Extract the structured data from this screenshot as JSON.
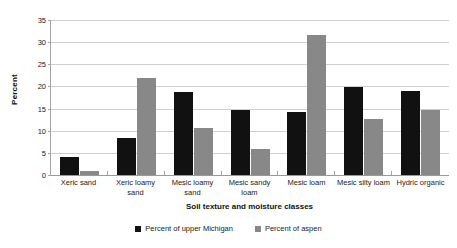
{
  "chart_data": {
    "type": "bar",
    "title": "",
    "xlabel": "Soil texture and moisture classes",
    "ylabel": "Percent",
    "ylim": [
      0,
      35
    ],
    "yticks": [
      0,
      5,
      10,
      15,
      20,
      25,
      30,
      35
    ],
    "grid": true,
    "legend_position": "bottom",
    "categories": [
      "Xeric sand",
      "Xeric loamy sand",
      "Mesic loamy sand",
      "Mesic sandy loam",
      "Mesic loam",
      "Mesic silty loam",
      "Hydric organic"
    ],
    "series": [
      {
        "name": "Percent of upper Michigan",
        "color": "#111111",
        "values": [
          4.0,
          8.4,
          18.8,
          14.7,
          14.3,
          19.8,
          19.0
        ]
      },
      {
        "name": "Percent of aspen",
        "color": "#888888",
        "values": [
          0.8,
          21.8,
          10.6,
          5.9,
          31.7,
          12.7,
          14.7
        ]
      }
    ]
  },
  "axes": {
    "y_title": "Percent",
    "x_title": "Soil texture and moisture classes",
    "y_tick_labels": [
      "0",
      "5",
      "10",
      "15",
      "20",
      "25",
      "30",
      "35"
    ],
    "x_tick_labels": [
      "Xeric sand",
      "Xeric loamy sand",
      "Mesic loamy sand",
      "Mesic sandy loam",
      "Mesic loam",
      "Mesic silty loam",
      "Hydric organic"
    ]
  },
  "legend": {
    "items": [
      {
        "label": "Percent of upper Michigan",
        "color": "#111111"
      },
      {
        "label": "Percent of aspen",
        "color": "#888888"
      }
    ]
  }
}
